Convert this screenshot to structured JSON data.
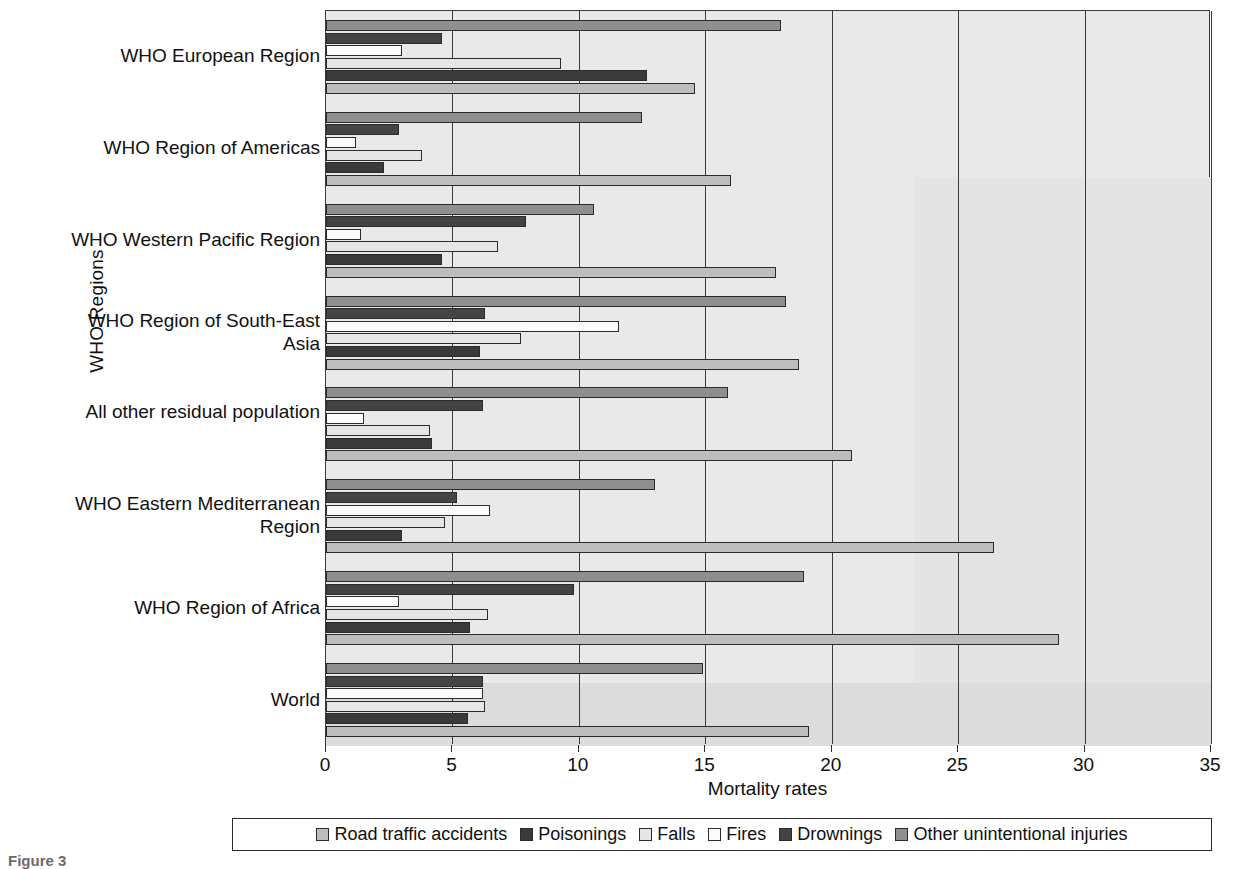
{
  "chart_data": {
    "type": "bar",
    "orientation": "horizontal",
    "title": "",
    "xlabel": "Mortality rates",
    "ylabel": "WHO Regions",
    "xlim": [
      0,
      35
    ],
    "xticks": [
      0,
      5,
      10,
      15,
      20,
      25,
      30,
      35
    ],
    "grid": "vertical",
    "legend_position": "bottom",
    "categories": [
      "WHO European Region",
      "WHO Region of Americas",
      "WHO Western Pacific Region",
      "WHO Region of South-East Asia",
      "All other residual population",
      "WHO Eastern Mediterranean Region",
      "WHO Region of Africa",
      "World"
    ],
    "series": [
      {
        "name": "Road traffic accidents",
        "color": "#bdbdbd",
        "values": [
          14.6,
          16.0,
          17.8,
          18.7,
          20.8,
          26.4,
          29.0,
          19.1
        ]
      },
      {
        "name": "Poisonings",
        "color": "#3a3a3a",
        "values": [
          12.7,
          2.3,
          4.6,
          6.1,
          4.2,
          3.0,
          5.7,
          5.6
        ]
      },
      {
        "name": "Falls",
        "color": "#e6e6e6",
        "values": [
          9.3,
          3.8,
          6.8,
          7.7,
          4.1,
          4.7,
          6.4,
          6.3
        ]
      },
      {
        "name": "Fires",
        "color": "#fbfbfb",
        "values": [
          3.0,
          1.2,
          1.4,
          11.6,
          1.5,
          6.5,
          2.9,
          6.2
        ]
      },
      {
        "name": "Drownings",
        "color": "#444444",
        "values": [
          4.6,
          2.9,
          7.9,
          6.3,
          6.2,
          5.2,
          9.8,
          6.2
        ]
      },
      {
        "name": "Other unintentional injuries",
        "color": "#8f8f8f",
        "values": [
          18.0,
          12.5,
          10.6,
          18.2,
          15.9,
          13.0,
          18.9,
          14.9
        ]
      }
    ]
  },
  "axis": {
    "y_title": "WHO Regions",
    "x_title": "Mortality rates",
    "x_ticks": [
      "0",
      "5",
      "10",
      "15",
      "20",
      "25",
      "30",
      "35"
    ]
  },
  "legend": {
    "items": [
      "Road traffic accidents",
      "Poisonings",
      "Falls",
      "Fires",
      "Drownings",
      "Other unintentional injuries"
    ]
  },
  "caption": "Figure 3"
}
